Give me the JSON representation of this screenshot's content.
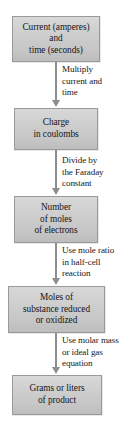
{
  "diagram": {
    "orientation": "vertical",
    "box_fill_color": "#cfcfcf",
    "box_border_color": "#9a9a9a",
    "arrow_color": "#8d8d8d",
    "background_color": "#ffffff",
    "text_color": "#15151a"
  },
  "nodes": [
    {
      "id": "current-time",
      "lines": [
        "Current (amperes)",
        "and",
        "time (seconds)"
      ]
    },
    {
      "id": "charge",
      "lines": [
        "Charge",
        "in coulombs"
      ]
    },
    {
      "id": "moles-electrons",
      "lines": [
        "Number",
        "of moles",
        "of electrons"
      ]
    },
    {
      "id": "moles-substance",
      "lines": [
        "Moles of",
        "substance reduced",
        "or oxidized"
      ]
    },
    {
      "id": "grams-liters",
      "lines": [
        "Grams or liters",
        "of product"
      ]
    }
  ],
  "arrows": [
    {
      "id": "arrow-multiply",
      "label_lines": [
        "Multiply",
        "current and",
        "time"
      ]
    },
    {
      "id": "arrow-faraday",
      "label_lines": [
        "Divide by",
        "the Faraday",
        "constant"
      ]
    },
    {
      "id": "arrow-mole-ratio",
      "label_lines": [
        "Use mole ratio",
        "in half-cell",
        "reaction"
      ]
    },
    {
      "id": "arrow-molar-mass",
      "label_lines": [
        "Use molar mass",
        "or ideal gas",
        "equation"
      ]
    }
  ]
}
